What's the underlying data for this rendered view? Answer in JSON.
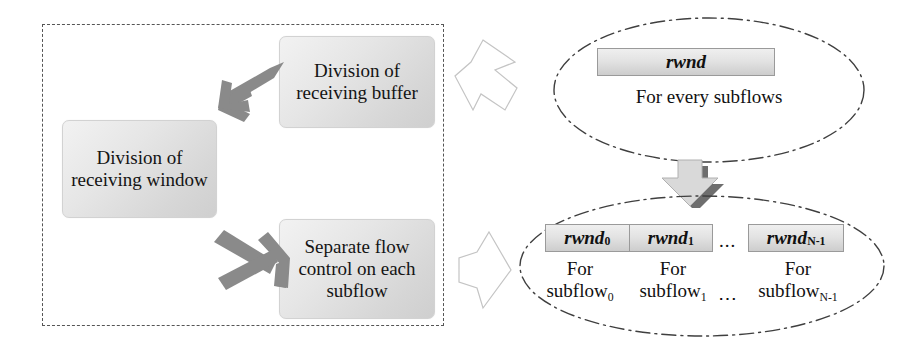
{
  "figure": {
    "kind": "block-diagram"
  },
  "left_panel": {
    "boundary_style": "dashed-rectangle",
    "boxes": [
      {
        "id": "division-receiving-buffer",
        "line1": "Division of",
        "line2": "receiving buffer"
      },
      {
        "id": "division-receiving-window",
        "line1": "Division of",
        "line2": "receiving window"
      },
      {
        "id": "separate-flow-control",
        "line1": "Separate flow",
        "line2": "control on each",
        "line3": "subflow"
      }
    ],
    "arrows": [
      {
        "id": "arrow-buffer-to-window",
        "direction": "down-left",
        "style": "solid-gray"
      },
      {
        "id": "arrow-window-to-subflow",
        "direction": "down-right",
        "style": "solid-gray"
      }
    ]
  },
  "right_panel": {
    "top_group": {
      "boundary_style": "dash-dot-ellipse",
      "bar_label": "rwnd",
      "caption": "For every subflows"
    },
    "transition_arrow": {
      "id": "arrow-split-down",
      "direction": "down",
      "style": "3d-block"
    },
    "bottom_group": {
      "boundary_style": "dash-dot-ellipse",
      "segments": [
        {
          "bar": "rwnd",
          "bar_sub": "0",
          "caption_line1": "For",
          "caption_line2": "subflow",
          "caption_sub": "0"
        },
        {
          "bar": "rwnd",
          "bar_sub": "1",
          "caption_line1": "For",
          "caption_line2": "subflow",
          "caption_sub": "1"
        },
        {
          "bar": "rwnd",
          "bar_sub": "N-1",
          "caption_line1": "For",
          "caption_line2": "subflow",
          "caption_sub": "N-1"
        }
      ],
      "bar_ellipsis": "...",
      "caption_ellipsis": "⋯"
    }
  },
  "connectors": [
    {
      "id": "hollow-arrow-top",
      "direction": "left",
      "style": "hollow-outline"
    },
    {
      "id": "hollow-arrow-bottom",
      "direction": "left",
      "style": "hollow-outline"
    }
  ],
  "colors": {
    "box_fill_light": "#f2f2f2",
    "box_fill_dark": "#cfcfcf",
    "box_border": "#d2d2d2",
    "dashed_border": "#555555",
    "ellipse_stroke": "#3f3f3f",
    "gray_arrow": "#8a8a8a",
    "hollow_arrow_stroke": "#c0c0c0",
    "arrow3d_body": "#d8d8d8",
    "arrow3d_shadow": "#6e6e6e",
    "text": "#111111"
  }
}
